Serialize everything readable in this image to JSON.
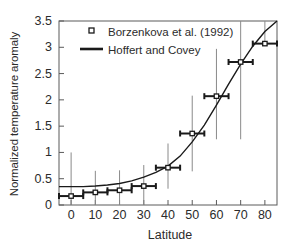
{
  "chart_data": {
    "type": "scatter",
    "title": "",
    "xlabel": "Latitude",
    "ylabel": "Normalized temperature aromaly",
    "xlim": [
      -5,
      85
    ],
    "ylim": [
      0,
      3.5
    ],
    "xticks": [
      0,
      10,
      20,
      30,
      40,
      50,
      60,
      70,
      80
    ],
    "xtick_labels": [
      "0",
      "10",
      "20",
      "30",
      "40",
      "50",
      "60",
      "70",
      "80"
    ],
    "yticks": [
      0,
      0.5,
      1,
      1.5,
      2,
      2.5,
      3,
      3.5
    ],
    "ytick_labels": [
      "0",
      "0.5",
      "1",
      "1.5",
      "2",
      "2.5",
      "3",
      "3.5"
    ],
    "grid": false,
    "legend_position": "upper-left",
    "legend": [
      {
        "label": "Borzenkova et al. (1992)",
        "marker": "square-open",
        "style": "marker"
      },
      {
        "label": "Hoffert and Covey",
        "marker": "line",
        "style": "line"
      }
    ],
    "series": [
      {
        "name": "Borzenkova et al. (1992)",
        "type": "scatter-errorbar",
        "marker": "square-open",
        "x": [
          0,
          10,
          20,
          30,
          40,
          50,
          60,
          70,
          80
        ],
        "values": [
          0.17,
          0.24,
          0.28,
          0.36,
          0.71,
          1.36,
          2.07,
          2.72,
          3.07
        ],
        "xerr": [
          5,
          5,
          5,
          5,
          5,
          5,
          5,
          5,
          5
        ],
        "yerr_low": [
          0.17,
          0.24,
          0.28,
          0.36,
          0.4,
          0.72,
          0.82,
          1.47,
          0.0
        ],
        "yerr_high": [
          0.83,
          0.41,
          0.38,
          0.4,
          0.46,
          0.72,
          0.9,
          0.78,
          0.43
        ]
      },
      {
        "name": "Hoffert and Covey",
        "type": "line",
        "x": [
          -5,
          0,
          5,
          10,
          15,
          20,
          25,
          30,
          35,
          40,
          45,
          50,
          55,
          60,
          65,
          70,
          75,
          80,
          85
        ],
        "values": [
          0.35,
          0.35,
          0.35,
          0.36,
          0.38,
          0.41,
          0.46,
          0.53,
          0.62,
          0.74,
          0.93,
          1.2,
          1.52,
          1.9,
          2.3,
          2.68,
          3.02,
          3.3,
          3.5
        ]
      }
    ],
    "colors": {
      "marker_edge": "#1a1a1a",
      "marker_face": "#ffffff",
      "errorbar_x": "#1a1a1a",
      "errorbar_y": "#8a8a8a",
      "curve": "#1a1a1a",
      "axis": "#5a5a5a",
      "background": "#ffffff"
    }
  }
}
